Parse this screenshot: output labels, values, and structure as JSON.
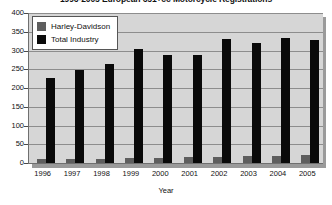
{
  "chart_data": {
    "type": "bar",
    "title": "1996-2005 European 651+cc Motorcycle Registrations",
    "xlabel": "Year",
    "ylabel": "",
    "ylim": [
      0,
      400
    ],
    "ytick_step": 50,
    "yticks": [
      0,
      50,
      100,
      150,
      200,
      250,
      300,
      350,
      400
    ],
    "grid": true,
    "legend_position": "top-left",
    "categories": [
      "1996",
      "1997",
      "1998",
      "1999",
      "2000",
      "2001",
      "2002",
      "2003",
      "2004",
      "2005"
    ],
    "series": [
      {
        "name": "Harley-Davidson",
        "color": "#5e5e5e",
        "values": [
          10,
          11,
          12,
          14,
          14,
          15,
          17,
          18,
          19,
          21
        ]
      },
      {
        "name": "Total Industry",
        "color": "#0a0a0a",
        "values": [
          228,
          248,
          265,
          303,
          288,
          289,
          330,
          320,
          333,
          327
        ]
      }
    ]
  },
  "legend": {
    "items": [
      {
        "label": "Harley-Davidson",
        "swatch": "#5e5e5e"
      },
      {
        "label": "Total Industry",
        "swatch": "#0a0a0a"
      }
    ]
  }
}
